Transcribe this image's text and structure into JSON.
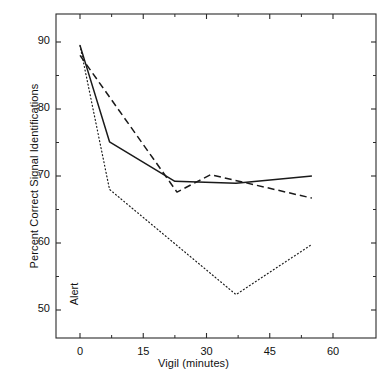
{
  "chart_data": {
    "type": "line",
    "title": "",
    "xlabel": "Vigil (minutes)",
    "ylabel": "Percent Correct Signal Identifications",
    "xlim": [
      -5,
      68
    ],
    "ylim": [
      46,
      94
    ],
    "xticks": [
      0,
      15,
      30,
      45,
      60
    ],
    "xticklabels": [
      "0",
      "15",
      "30",
      "45",
      "60"
    ],
    "xminorticks": [
      7.5,
      22.5,
      37.5,
      52.5
    ],
    "yticks": [
      50,
      60,
      70,
      80,
      90
    ],
    "yticklabels": [
      "50",
      "60",
      "70",
      "80",
      "90"
    ],
    "yminorticks": [
      55,
      65,
      75,
      85
    ],
    "grid": false,
    "legend": "none",
    "frame": "box",
    "annotations": [
      {
        "text": "Alert",
        "x": 1.5,
        "y": 51,
        "rotation": 90
      }
    ],
    "series": [
      {
        "name": "solid",
        "style": "solid",
        "color": "#1a1a1a",
        "x": [
          0,
          7,
          22.5,
          37,
          55
        ],
        "y": [
          89.5,
          75.1,
          69.2,
          68.9,
          70.0
        ]
      },
      {
        "name": "dashed",
        "style": "dashed",
        "color": "#1a1a1a",
        "x": [
          0,
          23,
          31,
          55
        ],
        "y": [
          88.0,
          67.6,
          70.2,
          66.7
        ]
      },
      {
        "name": "dotted",
        "style": "dotted",
        "color": "#1a1a1a",
        "x": [
          0,
          7,
          37,
          55
        ],
        "y": [
          89.5,
          68.0,
          52.3,
          59.8
        ]
      }
    ]
  },
  "axes": {
    "ylabel_text": "Percent Correct Signal Identifications",
    "xlabel_text": "Vigil (minutes)",
    "alert_label": "Alert"
  }
}
